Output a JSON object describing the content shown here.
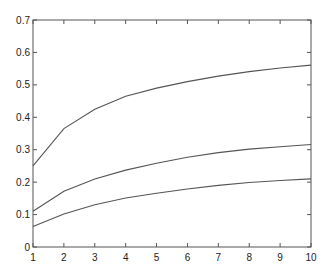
{
  "chart_data": {
    "type": "line",
    "title": "",
    "xlabel": "",
    "ylabel": "",
    "x": [
      1,
      2,
      3,
      4,
      5,
      6,
      7,
      8,
      9,
      10
    ],
    "xlim": [
      1,
      10
    ],
    "ylim": [
      0,
      0.7
    ],
    "xticks": [
      "1",
      "2",
      "3",
      "4",
      "5",
      "6",
      "7",
      "8",
      "9",
      "10"
    ],
    "yticks": [
      "0",
      "0.1",
      "0.2",
      "0.3",
      "0.4",
      "0.5",
      "0.6",
      "0.7"
    ],
    "grid": false,
    "legend": null,
    "series": [
      {
        "name": "upper",
        "color": "#555555",
        "values": [
          0.25,
          0.365,
          0.425,
          0.465,
          0.49,
          0.51,
          0.527,
          0.541,
          0.552,
          0.561
        ]
      },
      {
        "name": "middle",
        "color": "#555555",
        "values": [
          0.11,
          0.172,
          0.21,
          0.237,
          0.258,
          0.277,
          0.291,
          0.302,
          0.309,
          0.316
        ]
      },
      {
        "name": "lower",
        "color": "#555555",
        "values": [
          0.063,
          0.102,
          0.13,
          0.151,
          0.166,
          0.179,
          0.19,
          0.199,
          0.205,
          0.21
        ]
      }
    ]
  },
  "layout": {
    "plot_left": 33,
    "plot_right": 311,
    "plot_top": 20,
    "plot_bottom": 247,
    "axis_color": "#555555"
  }
}
